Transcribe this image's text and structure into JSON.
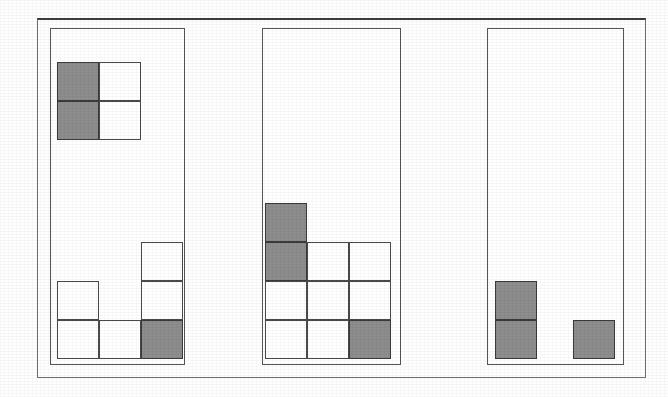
{
  "figure": {
    "canvas": {
      "width": 668,
      "height": 397,
      "background": "#fefefe"
    },
    "colors": {
      "filled": "#8d8d8d",
      "empty": "#ffffff",
      "cell_stroke": "#4a4a4a",
      "panel_stroke": "#555555",
      "frame_stroke": "#6f6f6f",
      "frame_top_stroke": "#3d3d3d"
    },
    "outer_frame": {
      "x": 37,
      "y": 18,
      "width": 609,
      "height": 360
    },
    "cell_size": {
      "width": 42,
      "height": 39
    },
    "legend": {
      "filled_label": "shaded square",
      "empty_label": "unshaded square"
    }
  },
  "panels": [
    {
      "name": "panel-1",
      "label": "Panel 1",
      "box": {
        "x": 50,
        "y": 28,
        "width": 135,
        "height": 337
      },
      "groups": [
        {
          "name": "top-block",
          "label": "Top 2x2 block",
          "columns": [
            {
              "name": "col-1",
              "x": 57,
              "bottom": 140,
              "cells": [
                "filled",
                "filled"
              ]
            },
            {
              "name": "col-2",
              "x": 99,
              "bottom": 140,
              "cells": [
                "empty",
                "empty"
              ]
            }
          ]
        },
        {
          "name": "bottom-block",
          "label": "Bottom stack group",
          "columns": [
            {
              "name": "col-1",
              "x": 57,
              "bottom": 359,
              "cells": [
                "empty",
                "empty"
              ]
            },
            {
              "name": "col-2",
              "x": 99,
              "bottom": 359,
              "cells": [
                "empty"
              ]
            },
            {
              "name": "col-3",
              "x": 141,
              "bottom": 359,
              "cells": [
                "filled",
                "empty",
                "empty"
              ]
            }
          ]
        }
      ]
    },
    {
      "name": "panel-2",
      "label": "Panel 2",
      "box": {
        "x": 262,
        "y": 28,
        "width": 139,
        "height": 337
      },
      "groups": [
        {
          "name": "main-block",
          "label": "Main stack group",
          "columns": [
            {
              "name": "col-1",
              "x": 265,
              "bottom": 359,
              "cells": [
                "empty",
                "empty",
                "filled",
                "filled"
              ]
            },
            {
              "name": "col-2",
              "x": 307,
              "bottom": 359,
              "cells": [
                "empty",
                "empty",
                "empty"
              ]
            },
            {
              "name": "col-3",
              "x": 349,
              "bottom": 359,
              "cells": [
                "filled",
                "empty",
                "empty"
              ]
            }
          ]
        }
      ]
    },
    {
      "name": "panel-3",
      "label": "Panel 3",
      "box": {
        "x": 487,
        "y": 28,
        "width": 137,
        "height": 337
      },
      "groups": [
        {
          "name": "main-block",
          "label": "Main stack group",
          "columns": [
            {
              "name": "col-1",
              "x": 495,
              "bottom": 359,
              "cells": [
                "filled",
                "filled"
              ]
            },
            {
              "name": "col-3",
              "x": 573,
              "bottom": 359,
              "cells": [
                "filled"
              ]
            }
          ]
        }
      ]
    }
  ],
  "chart_data": {
    "type": "bar",
    "xlabel": "",
    "ylabel": "units stacked",
    "panel_labels": [
      "Panel 1",
      "Panel 2",
      "Panel 3"
    ],
    "series": [
      {
        "name": "Panel 1 - top block",
        "categories": [
          "col 1",
          "col 2"
        ],
        "values": [
          2,
          2
        ],
        "shading": [
          [
            "filled",
            "filled"
          ],
          [
            "empty",
            "empty"
          ]
        ]
      },
      {
        "name": "Panel 1 - bottom block",
        "categories": [
          "col 1",
          "col 2",
          "col 3"
        ],
        "values": [
          2,
          1,
          3
        ],
        "shading": [
          [
            "empty",
            "empty"
          ],
          [
            "empty"
          ],
          [
            "filled",
            "empty",
            "empty"
          ]
        ]
      },
      {
        "name": "Panel 2 - main block",
        "categories": [
          "col 1",
          "col 2",
          "col 3"
        ],
        "values": [
          4,
          3,
          3
        ],
        "shading": [
          [
            "empty",
            "empty",
            "filled",
            "filled"
          ],
          [
            "empty",
            "empty",
            "empty"
          ],
          [
            "filled",
            "empty",
            "empty"
          ]
        ]
      },
      {
        "name": "Panel 3 - main block",
        "categories": [
          "col 1",
          "col 2",
          "col 3"
        ],
        "values": [
          2,
          0,
          1
        ],
        "shading": [
          [
            "filled",
            "filled"
          ],
          [],
          [
            "filled"
          ]
        ]
      }
    ],
    "totals": {
      "filled_squares": 9,
      "empty_squares": 13,
      "total_squares": 22
    },
    "grid": false,
    "legend_position": "none"
  }
}
